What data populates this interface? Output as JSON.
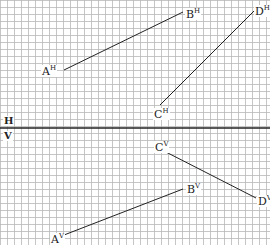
{
  "diagram": {
    "type": "orthographic projection on grid paper",
    "grid": {
      "spacing_px": 7,
      "color": "#b8b8b8"
    },
    "divider": {
      "y": 128,
      "color": "#222222",
      "top_label": "H",
      "bottom_label": "V"
    },
    "line_color": "#222222",
    "horizontal_plane": {
      "segments": [
        {
          "name": "AB",
          "from": "A",
          "to": "B"
        },
        {
          "name": "CD",
          "from": "C",
          "to": "D"
        }
      ],
      "points": {
        "A": {
          "label": "A",
          "sup": "H",
          "x": 64,
          "y": 70
        },
        "B": {
          "label": "B",
          "sup": "H",
          "x": 183,
          "y": 12
        },
        "C": {
          "label": "C",
          "sup": "H",
          "x": 160,
          "y": 105
        },
        "D": {
          "label": "D",
          "sup": "H",
          "x": 255,
          "y": 10
        }
      }
    },
    "vertical_plane": {
      "segments": [
        {
          "name": "AB",
          "from": "A",
          "to": "B"
        },
        {
          "name": "CD",
          "from": "C",
          "to": "D"
        }
      ],
      "points": {
        "A": {
          "label": "A",
          "sup": "V",
          "x": 64,
          "y": 235
        },
        "B": {
          "label": "B",
          "sup": "V",
          "x": 183,
          "y": 189
        },
        "C": {
          "label": "C",
          "sup": "V",
          "x": 162,
          "y": 150
        },
        "D": {
          "label": "D",
          "sup": "V",
          "x": 256,
          "y": 198
        }
      }
    }
  }
}
